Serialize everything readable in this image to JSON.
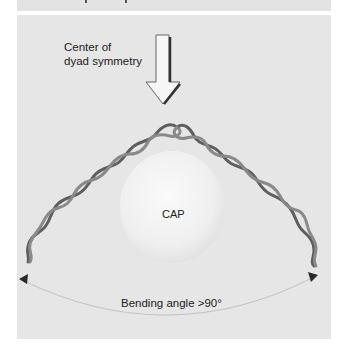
{
  "diagram": {
    "header_strip": {
      "text_visible": false
    },
    "pointer": {
      "label_line1": "Center of",
      "label_line2": "dyad symmetry",
      "icon": "down-arrow-icon"
    },
    "protein": {
      "label": "CAP"
    },
    "dna": {
      "description": "bent DNA double helix"
    },
    "bend": {
      "label": "Bending angle >90°"
    },
    "colors": {
      "panel": "#e6e6e6",
      "helix": "#6a6a6a",
      "sphere": "#f4f4f4",
      "arc": "#c9c9c9",
      "text": "#222222"
    }
  }
}
